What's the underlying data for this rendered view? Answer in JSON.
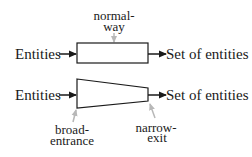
{
  "diagram": {
    "row1": {
      "input_label": "Entities",
      "output_label": "Set of entities",
      "annotation_line1": "normal-",
      "annotation_line2": "way",
      "shape": "rectangle"
    },
    "row2": {
      "input_label": "Entities",
      "output_label": "Set of entities",
      "left_annotation_line1": "broad-",
      "left_annotation_line2": "entrance",
      "right_annotation_line1": "narrow-",
      "right_annotation_line2": "exit",
      "shape": "funnel-trapezoid"
    },
    "colors": {
      "stroke": "#1a1a1a",
      "annotation_arrow": "#b8b8b8",
      "background": "#ffffff"
    }
  }
}
